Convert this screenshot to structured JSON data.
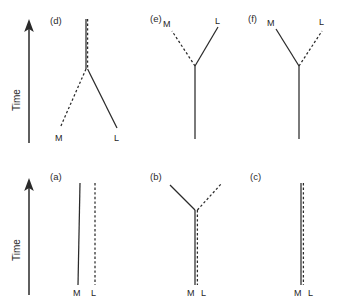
{
  "figure": {
    "type": "diagram",
    "background_color": "#ffffff",
    "line_color": "#2a2a2a",
    "width": 344,
    "height": 305
  },
  "axes": [
    {
      "id": "time-axis-top",
      "label": "Time",
      "direction": "upward",
      "x": 29,
      "y_top": 22,
      "y_bottom": 143
    },
    {
      "id": "time-axis-bottom",
      "label": "Time",
      "direction": "upward",
      "x": 29,
      "y_top": 178,
      "y_bottom": 295
    }
  ],
  "legend": {
    "solid_label": "M",
    "dashed_label": "L",
    "solid_meaning": "M lineage (solid line)",
    "dashed_meaning": "L lineage (dashed line)"
  },
  "panels": [
    {
      "id": "panel-d",
      "label": "(d)",
      "label_x": 50,
      "label_y": 24,
      "row": "top",
      "topology": "divergent-downward-split",
      "trunk": {
        "style": "overlapping",
        "x": 86,
        "y_top": 19,
        "y_bottom": 69
      },
      "branches": [
        {
          "name": "M",
          "style": "dashed",
          "x1": 86,
          "y1": 69,
          "x2": 60,
          "y2": 128,
          "tip_label": "M",
          "tip_x": 55,
          "tip_y": 141
        },
        {
          "name": "L",
          "style": "solid",
          "x1": 86,
          "y1": 69,
          "x2": 117,
          "y2": 128,
          "tip_label": "L",
          "tip_x": 114,
          "tip_y": 141
        }
      ]
    },
    {
      "id": "panel-e",
      "label": "(e)",
      "label_x": 150,
      "label_y": 22,
      "row": "top",
      "topology": "upward-split-M-dashed-left",
      "trunk": {
        "style": "solid",
        "x": 195,
        "y_top": 66,
        "y_bottom": 139
      },
      "branches": [
        {
          "name": "M",
          "style": "dashed",
          "x1": 195,
          "y1": 66,
          "x2": 172,
          "y2": 31,
          "tip_label": "M",
          "tip_x": 163,
          "tip_y": 27
        },
        {
          "name": "L",
          "style": "solid",
          "x1": 195,
          "y1": 66,
          "x2": 218,
          "y2": 27,
          "tip_label": "L",
          "tip_x": 215,
          "tip_y": 24
        }
      ]
    },
    {
      "id": "panel-f",
      "label": "(f)",
      "label_x": 248,
      "label_y": 22,
      "row": "top",
      "topology": "upward-split-M-solid-left",
      "trunk": {
        "style": "solid",
        "x": 299,
        "y_top": 66,
        "y_bottom": 139
      },
      "branches": [
        {
          "name": "M",
          "style": "solid",
          "x1": 299,
          "y1": 66,
          "x2": 276,
          "y2": 29,
          "tip_label": "M",
          "tip_x": 267,
          "tip_y": 26
        },
        {
          "name": "L",
          "style": "dashed",
          "x1": 299,
          "y1": 66,
          "x2": 322,
          "y2": 31,
          "tip_label": "L",
          "tip_x": 319,
          "tip_y": 25
        }
      ]
    },
    {
      "id": "panel-a",
      "label": "(a)",
      "label_x": 50,
      "label_y": 180,
      "row": "bottom",
      "topology": "parallel-separate-lineages",
      "branches": [
        {
          "name": "M",
          "style": "solid",
          "x1": 80,
          "y1": 183,
          "x2": 78,
          "y2": 285,
          "tip_label": "M",
          "tip_x": 73,
          "tip_y": 296
        },
        {
          "name": "L",
          "style": "dashed",
          "x1": 95,
          "y1": 183,
          "x2": 95,
          "y2": 285,
          "tip_label": "L",
          "tip_x": 91,
          "tip_y": 296
        }
      ]
    },
    {
      "id": "panel-b",
      "label": "(b)",
      "label_x": 150,
      "label_y": 180,
      "row": "bottom",
      "topology": "shared-trunk-upward-split",
      "trunk": {
        "style": "overlapping",
        "x": 196,
        "y_top": 210,
        "y_bottom": 285
      },
      "branches": [
        {
          "name": "M",
          "style": "solid",
          "x1": 196,
          "y1": 210,
          "x2": 170,
          "y2": 185,
          "tip_label": "M",
          "tip_x": 187,
          "tip_y": 296
        },
        {
          "name": "L",
          "style": "dashed",
          "x1": 196,
          "y1": 210,
          "x2": 222,
          "y2": 183,
          "tip_label": "L",
          "tip_x": 201,
          "tip_y": 296
        }
      ]
    },
    {
      "id": "panel-c",
      "label": "(c)",
      "label_x": 250,
      "label_y": 180,
      "row": "bottom",
      "topology": "fully-overlapping-single-lineage",
      "trunk": {
        "style": "overlapping",
        "x": 303,
        "y_top": 183,
        "y_bottom": 285
      },
      "branches": [
        {
          "name": "M",
          "style": "solid",
          "tip_label": "M",
          "tip_x": 294,
          "tip_y": 296
        },
        {
          "name": "L",
          "style": "dashed",
          "tip_label": "L",
          "tip_x": 308,
          "tip_y": 296
        }
      ]
    }
  ]
}
